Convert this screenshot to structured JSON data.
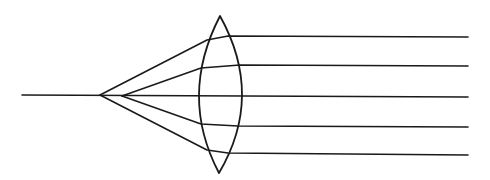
{
  "diagram": {
    "title": "",
    "colors": {
      "line": "#1a1a1a",
      "background": "#ffffff"
    },
    "optical_axis": {
      "x1": 22,
      "y1": 95,
      "x2": 468,
      "y2": 97
    },
    "lens": {
      "type": "biconvex",
      "top": [
        220,
        16
      ],
      "bottom": [
        219,
        173
      ],
      "left_bulge_x": 199,
      "right_bulge_x": 242,
      "center_y": 96
    },
    "focal_points": {
      "marginal": [
        100,
        95
      ],
      "paraxial": [
        122,
        96
      ]
    },
    "rays": [
      {
        "name": "marginal-upper",
        "points": [
          [
            100,
            95
          ],
          [
            207,
            40
          ],
          [
            228,
            36
          ],
          [
            468,
            37
          ]
        ]
      },
      {
        "name": "paraxial-upper",
        "points": [
          [
            122,
            96
          ],
          [
            201,
            68
          ],
          [
            240,
            65
          ],
          [
            468,
            66
          ]
        ]
      },
      {
        "name": "paraxial-lower",
        "points": [
          [
            122,
            96
          ],
          [
            201,
            124
          ],
          [
            238,
            126
          ],
          [
            468,
            127
          ]
        ]
      },
      {
        "name": "marginal-lower",
        "points": [
          [
            100,
            95
          ],
          [
            207,
            150
          ],
          [
            228,
            153
          ],
          [
            468,
            155
          ]
        ]
      }
    ]
  }
}
